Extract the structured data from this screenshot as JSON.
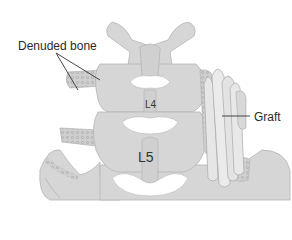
{
  "figure": {
    "labels": {
      "denuded_bone": "Denuded bone",
      "graft": "Graft",
      "vertebra_upper": "L4",
      "vertebra_lower": "L5"
    },
    "colors": {
      "background": "#ffffff",
      "bone_fill": "#d6d6d6",
      "bone_outline": "#b5b5b5",
      "cavity": "#ffffff",
      "graft_fill": "#e6e6e6",
      "graft_outline": "#a9a9a9",
      "denuded_texture": "#a8a8a8",
      "leader_line": "#333333",
      "text": "#2a2a2a"
    }
  }
}
